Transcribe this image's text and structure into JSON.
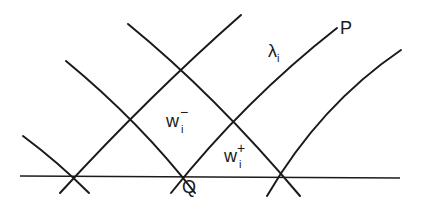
{
  "diagram": {
    "labels": {
      "P": "P",
      "Q": "Q",
      "lambda": {
        "base": "λ",
        "sub": "i"
      },
      "w_minus": {
        "base": "w",
        "sub": "i",
        "sup": "−"
      },
      "w_plus": {
        "base": "w",
        "sub": "i",
        "sup": "+"
      }
    },
    "colors": {
      "ink": "#1a1a1a",
      "background": "#ffffff"
    },
    "lines": [
      {
        "name": "horizontal-axis",
        "points": [
          [
            20,
            176
          ],
          [
            400,
            178
          ]
        ]
      },
      {
        "name": "rising-line-a",
        "points": [
          [
            60,
            193
          ],
          [
            241,
            15
          ]
        ]
      },
      {
        "name": "falling-line-b",
        "points": [
          [
            128,
            24
          ],
          [
            300,
            196
          ]
        ]
      },
      {
        "name": "falling-line-c",
        "points": [
          [
            66,
            61
          ],
          [
            195,
            193
          ]
        ]
      },
      {
        "name": "lambda-i-line",
        "points": [
          [
            171,
            193
          ],
          [
            337,
            28
          ]
        ]
      },
      {
        "name": "far-left-falling-line",
        "points": [
          [
            23,
            136
          ],
          [
            89,
            193
          ]
        ]
      },
      {
        "name": "far-right-rising-curve",
        "points": [
          [
            267,
            196
          ],
          [
            401,
            50
          ]
        ]
      }
    ]
  }
}
